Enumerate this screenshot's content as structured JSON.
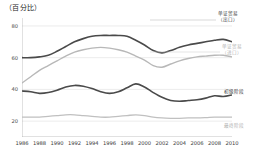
{
  "chart_data": {
    "type": "line",
    "title": "（百分比）",
    "xlabel": "",
    "ylabel": "百分比",
    "ylim": [
      10,
      85
    ],
    "xlim": [
      1986,
      2010
    ],
    "grid": true,
    "legend_position": "right-inline",
    "yticks": [
      80,
      60,
      40,
      20
    ],
    "xticks": [
      1986,
      1988,
      1990,
      1992,
      1994,
      1996,
      1998,
      2000,
      2002,
      2004,
      2006,
      2008,
      2010
    ],
    "x": [
      1986,
      1987,
      1988,
      1989,
      1990,
      1991,
      1992,
      1993,
      1994,
      1995,
      1996,
      1997,
      1998,
      1999,
      2000,
      2001,
      2002,
      2003,
      2004,
      2005,
      2006,
      2007,
      2008,
      2009,
      2010
    ],
    "series": [
      {
        "name": "单证贸易（出口）",
        "label_line1": "单证贸易",
        "label_line2": "（出口）",
        "color": "#4a4a4a",
        "width": 1.6,
        "values": [
          60,
          60,
          60.5,
          61.5,
          64,
          67,
          70,
          72,
          73.5,
          74,
          74,
          74,
          73.5,
          71,
          68,
          64.5,
          63,
          64.5,
          66.5,
          68,
          69,
          70,
          71,
          71.5,
          70
        ]
      },
      {
        "name": "单证贸易（进口）",
        "label_line1": "单证贸易",
        "label_line2": "（进口）",
        "color": "#b8b8b8",
        "width": 1.4,
        "values": [
          44,
          48,
          52,
          55,
          58,
          61,
          63.5,
          65,
          66,
          66.5,
          66,
          65,
          63.5,
          61,
          58.5,
          55,
          54,
          56,
          58,
          59.5,
          60.5,
          61,
          61.5,
          61.5,
          60.5
        ]
      },
      {
        "name": "初级阶段",
        "label_line1": "初级阶段",
        "label_line2": "",
        "color": "#4a4a4a",
        "width": 1.6,
        "values": [
          39,
          38.5,
          37.5,
          38,
          39.5,
          41.5,
          42.5,
          42,
          40.5,
          38.5,
          37.5,
          38.5,
          41,
          43.5,
          41.5,
          38,
          35,
          33,
          32.5,
          33,
          33.5,
          34.5,
          36,
          35.5,
          36.5
        ]
      },
      {
        "name": "最终阶段",
        "label_line1": "最终阶段",
        "label_line2": "",
        "color": "#c0c0c0",
        "width": 1.3,
        "values": [
          22.5,
          22.5,
          22.5,
          23,
          23.5,
          24,
          24,
          23.5,
          23,
          22.5,
          22.5,
          23,
          23.5,
          24,
          23.5,
          22.5,
          22,
          21.8,
          21.8,
          22,
          22,
          22.2,
          22.5,
          22.5,
          22.5
        ]
      }
    ]
  }
}
